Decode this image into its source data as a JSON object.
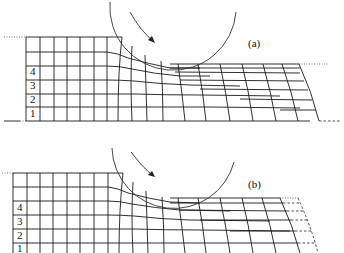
{
  "figure": {
    "panels": [
      {
        "id": "a",
        "label": "(a)",
        "row_labels": [
          "4",
          "3",
          "2",
          "1"
        ],
        "description": "Rolling deformation grid, elastic recovery absent"
      },
      {
        "id": "b",
        "label": "(b)",
        "row_labels": [
          "4",
          "3",
          "2",
          "1"
        ],
        "description": "Rolling deformation grid with dashed original-position lines at exit"
      }
    ],
    "colors": {
      "line": "#1a1a1a",
      "background": "#ffffff"
    }
  }
}
